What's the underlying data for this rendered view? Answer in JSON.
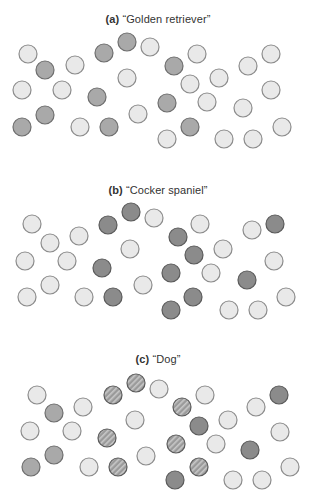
{
  "figure": {
    "colors": {
      "light_fill": "#e9e9e9",
      "light_stroke": "#8c8c8c",
      "golden_fill": "#a9a9a9",
      "golden_stroke": "#6e6e6e",
      "cocker_fill": "#8b8b8b",
      "cocker_stroke": "#5a5a5a",
      "stripe_fill": "#9a9a9a",
      "stripe_line": "#c8c8c8"
    },
    "radius": 9,
    "panels": [
      {
        "tag": "(a)",
        "label": "“Golden retriever”",
        "title_y": 13,
        "circles": [
          {
            "x": 28,
            "y": 54,
            "k": "light"
          },
          {
            "x": 45,
            "y": 70,
            "k": "golden"
          },
          {
            "x": 75,
            "y": 65,
            "k": "light"
          },
          {
            "x": 22,
            "y": 90,
            "k": "light"
          },
          {
            "x": 62,
            "y": 90,
            "k": "light"
          },
          {
            "x": 97,
            "y": 97,
            "k": "golden"
          },
          {
            "x": 104,
            "y": 53,
            "k": "golden"
          },
          {
            "x": 127,
            "y": 42,
            "k": "golden"
          },
          {
            "x": 150,
            "y": 47,
            "k": "light"
          },
          {
            "x": 127,
            "y": 78,
            "k": "light"
          },
          {
            "x": 45,
            "y": 115,
            "k": "golden"
          },
          {
            "x": 22,
            "y": 127,
            "k": "golden"
          },
          {
            "x": 80,
            "y": 127,
            "k": "light"
          },
          {
            "x": 109,
            "y": 127,
            "k": "golden"
          },
          {
            "x": 138,
            "y": 114,
            "k": "light"
          },
          {
            "x": 197,
            "y": 54,
            "k": "light"
          },
          {
            "x": 174,
            "y": 66,
            "k": "golden"
          },
          {
            "x": 219,
            "y": 78,
            "k": "light"
          },
          {
            "x": 190,
            "y": 84,
            "k": "light"
          },
          {
            "x": 248,
            "y": 66,
            "k": "light"
          },
          {
            "x": 271,
            "y": 54,
            "k": "light"
          },
          {
            "x": 167,
            "y": 103,
            "k": "golden"
          },
          {
            "x": 207,
            "y": 102,
            "k": "light"
          },
          {
            "x": 243,
            "y": 108,
            "k": "light"
          },
          {
            "x": 271,
            "y": 90,
            "k": "light"
          },
          {
            "x": 190,
            "y": 127,
            "k": "golden"
          },
          {
            "x": 167,
            "y": 139,
            "k": "light"
          },
          {
            "x": 224,
            "y": 139,
            "k": "light"
          },
          {
            "x": 253,
            "y": 139,
            "k": "light"
          },
          {
            "x": 282,
            "y": 127,
            "k": "light"
          }
        ]
      },
      {
        "tag": "(b)",
        "label": "“Cocker spaniel”",
        "title_y": 184,
        "circles": [
          {
            "x": 32,
            "y": 224,
            "k": "light"
          },
          {
            "x": 50,
            "y": 243,
            "k": "light"
          },
          {
            "x": 79,
            "y": 236,
            "k": "light"
          },
          {
            "x": 25,
            "y": 261,
            "k": "light"
          },
          {
            "x": 67,
            "y": 261,
            "k": "light"
          },
          {
            "x": 108,
            "y": 225,
            "k": "cocker"
          },
          {
            "x": 131,
            "y": 212,
            "k": "cocker"
          },
          {
            "x": 154,
            "y": 218,
            "k": "light"
          },
          {
            "x": 130,
            "y": 249,
            "k": "light"
          },
          {
            "x": 102,
            "y": 268,
            "k": "cocker"
          },
          {
            "x": 143,
            "y": 285,
            "k": "light"
          },
          {
            "x": 27,
            "y": 297,
            "k": "light"
          },
          {
            "x": 50,
            "y": 285,
            "k": "light"
          },
          {
            "x": 84,
            "y": 297,
            "k": "light"
          },
          {
            "x": 113,
            "y": 297,
            "k": "cocker"
          },
          {
            "x": 200,
            "y": 224,
            "k": "light"
          },
          {
            "x": 178,
            "y": 237,
            "k": "cocker"
          },
          {
            "x": 194,
            "y": 255,
            "k": "cocker"
          },
          {
            "x": 223,
            "y": 249,
            "k": "light"
          },
          {
            "x": 171,
            "y": 273,
            "k": "cocker"
          },
          {
            "x": 211,
            "y": 273,
            "k": "light"
          },
          {
            "x": 252,
            "y": 230,
            "k": "light"
          },
          {
            "x": 275,
            "y": 224,
            "k": "cocker"
          },
          {
            "x": 274,
            "y": 261,
            "k": "light"
          },
          {
            "x": 247,
            "y": 280,
            "k": "cocker"
          },
          {
            "x": 193,
            "y": 297,
            "k": "cocker"
          },
          {
            "x": 171,
            "y": 310,
            "k": "cocker"
          },
          {
            "x": 229,
            "y": 310,
            "k": "light"
          },
          {
            "x": 258,
            "y": 310,
            "k": "light"
          },
          {
            "x": 286,
            "y": 297,
            "k": "light"
          }
        ]
      },
      {
        "tag": "(c)",
        "label": "“Dog”",
        "title_y": 353,
        "circles": [
          {
            "x": 37,
            "y": 395,
            "k": "light"
          },
          {
            "x": 54,
            "y": 413,
            "k": "golden"
          },
          {
            "x": 83,
            "y": 407,
            "k": "light"
          },
          {
            "x": 30,
            "y": 431,
            "k": "light"
          },
          {
            "x": 72,
            "y": 431,
            "k": "light"
          },
          {
            "x": 113,
            "y": 395,
            "k": "striped"
          },
          {
            "x": 136,
            "y": 383,
            "k": "striped"
          },
          {
            "x": 159,
            "y": 389,
            "k": "light"
          },
          {
            "x": 135,
            "y": 420,
            "k": "light"
          },
          {
            "x": 107,
            "y": 438,
            "k": "striped"
          },
          {
            "x": 146,
            "y": 456,
            "k": "light"
          },
          {
            "x": 31,
            "y": 467,
            "k": "golden"
          },
          {
            "x": 54,
            "y": 455,
            "k": "golden"
          },
          {
            "x": 89,
            "y": 467,
            "k": "light"
          },
          {
            "x": 118,
            "y": 467,
            "k": "striped"
          },
          {
            "x": 205,
            "y": 395,
            "k": "light"
          },
          {
            "x": 182,
            "y": 407,
            "k": "striped"
          },
          {
            "x": 199,
            "y": 426,
            "k": "cocker"
          },
          {
            "x": 228,
            "y": 420,
            "k": "light"
          },
          {
            "x": 176,
            "y": 444,
            "k": "striped"
          },
          {
            "x": 216,
            "y": 444,
            "k": "light"
          },
          {
            "x": 256,
            "y": 407,
            "k": "light"
          },
          {
            "x": 279,
            "y": 395,
            "k": "cocker"
          },
          {
            "x": 280,
            "y": 432,
            "k": "light"
          },
          {
            "x": 250,
            "y": 450,
            "k": "cocker"
          },
          {
            "x": 199,
            "y": 467,
            "k": "striped"
          },
          {
            "x": 175,
            "y": 480,
            "k": "cocker"
          },
          {
            "x": 233,
            "y": 480,
            "k": "light"
          },
          {
            "x": 262,
            "y": 480,
            "k": "light"
          },
          {
            "x": 290,
            "y": 467,
            "k": "light"
          }
        ]
      }
    ]
  }
}
